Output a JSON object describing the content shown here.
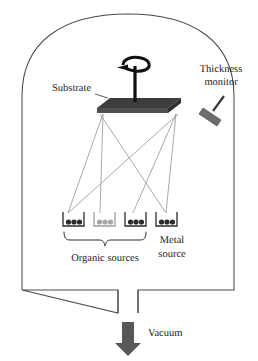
{
  "figure": {
    "canvas": {
      "width": 258,
      "height": 361
    },
    "background_color": "#ffffff"
  },
  "labels": {
    "substrate": "Substrate",
    "thickness_monitor_line1": "Thickness",
    "thickness_monitor_line2": "monitor",
    "organic_sources": "Organic sources",
    "metal_source_line1": "Metal",
    "metal_source_line2": "source",
    "vacuum": "Vacuum"
  },
  "colors": {
    "chamber_wall": "#4a4a4a",
    "flux_line": "#9a9a9a",
    "substrate_dark": "#3d3d3d",
    "crucible_dark": "#2b2b2b",
    "crucible_light": "#9d9d9d",
    "monitor_gray": "#6d6d6d",
    "vacuum_arrow": "#585858",
    "text": "#1a1a1a"
  },
  "components": {
    "chamber": {
      "name": "vacuum chamber",
      "left_wall_x": 22,
      "right_wall_x": 234,
      "floor_y": 290,
      "dome_apex_y": 14,
      "outlet_left_x": 118,
      "outlet_right_x": 138,
      "outlet_bottom_y": 313
    },
    "substrate": {
      "name": "rotating substrate holder",
      "plate_left_x": 97,
      "plate_right_x": 181,
      "plate_top_y": 98,
      "plate_bottom_y": 113,
      "rod_top_y": 66,
      "rotation": "clockwise"
    },
    "thickness_monitor": {
      "name": "quartz crystal thickness monitor",
      "head_center_x": 216,
      "head_center_y": 113,
      "angle_deg": 28
    },
    "sources": [
      {
        "index": 1,
        "type": "organic",
        "label_group": "Organic sources",
        "x": 63,
        "pellets": 3,
        "shade": "dark"
      },
      {
        "index": 2,
        "type": "organic",
        "label_group": "Organic sources",
        "x": 94,
        "pellets": 3,
        "shade": "light"
      },
      {
        "index": 3,
        "type": "organic",
        "label_group": "Organic sources",
        "x": 125,
        "pellets": 3,
        "shade": "dark"
      },
      {
        "index": 4,
        "type": "metal",
        "label_group": "Metal source",
        "x": 156,
        "pellets": 3,
        "shade": "dark"
      }
    ],
    "flux_lines": {
      "name": "evaporation flux cone lines",
      "count": 6,
      "pattern": "crossing-X"
    },
    "vacuum_arrow": {
      "name": "vacuum pump-out direction",
      "direction": "down",
      "x": 128,
      "top_y": 322,
      "bottom_y": 355
    }
  }
}
